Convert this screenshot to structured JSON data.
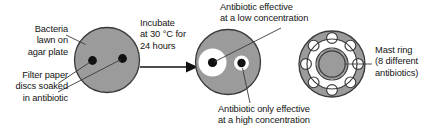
{
  "figure": {
    "colors": {
      "agar_grey": "#9b9b9b",
      "clear_zone": "#ffffff",
      "disc_black": "#111111",
      "outline": "#3a3a3a",
      "text": "#141414"
    }
  },
  "labels": {
    "bacteria_lawn": "Bacteria\nlawn on\nagar plate",
    "filter_paper": "Filter paper\ndiscs soaked\nin antibiotic",
    "incubate": "Incubate\nat 30 °C for\n24 hours",
    "low_concentration": "Antibiotic effective\nat a low concentration",
    "high_concentration": "Antibiotic only effective\nat a high concentration",
    "mast_ring": "Mast ring\n(8 different\nantibiotics)"
  },
  "plates": {
    "before": {
      "name": "untreated-agar-plate",
      "discs": 2,
      "zones": 0
    },
    "after": {
      "name": "incubated-agar-plate",
      "discs": 2,
      "zones": 2,
      "large_zone_side": "left",
      "small_zone_side": "right"
    },
    "mast_ring": {
      "name": "mast-ring-plate",
      "antibiotic_count": 8
    }
  },
  "arrow": {
    "name": "incubation-arrow",
    "direction": "right"
  }
}
